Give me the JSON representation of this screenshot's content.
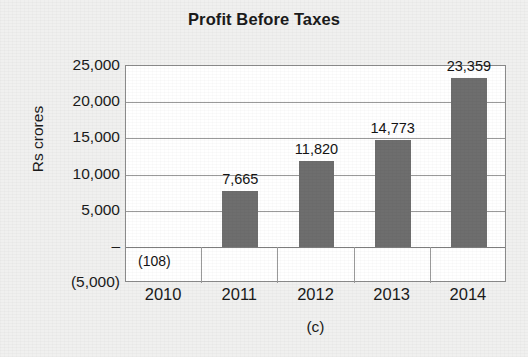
{
  "chart_data": {
    "type": "bar",
    "title": "Profit Before Taxes",
    "xlabel": "",
    "ylabel": "Rs crores",
    "categories": [
      "2010",
      "2011",
      "2012",
      "2013",
      "2014"
    ],
    "values": [
      -108,
      7665,
      11820,
      14773,
      23359
    ],
    "data_labels": [
      "(108)",
      "7,665",
      "11,820",
      "14,773",
      "23,359"
    ],
    "ylim": [
      -5000,
      25000
    ],
    "ytick_values": [
      25000,
      20000,
      15000,
      10000,
      5000,
      0,
      -5000
    ],
    "ytick_labels": [
      "25,000",
      "20,000",
      "15,000",
      "10,000",
      "5,000",
      "–",
      "(5,000)"
    ],
    "grid": true,
    "legend": null,
    "bar_color": "#6e6e6e",
    "plot_background": "#ffffff",
    "figure_background": "#f0f0ef",
    "caption": "(c)"
  }
}
